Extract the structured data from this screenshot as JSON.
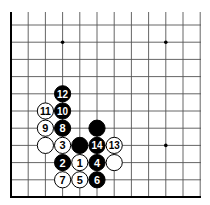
{
  "board": {
    "title": "Go board diagram (lower-left corner region)",
    "columns_visible": 12,
    "rows_visible": 11,
    "origin_x": 11,
    "origin_y": 197,
    "spacing": 17.2,
    "top_y": 12,
    "right_x": 201,
    "edges": {
      "left": true,
      "bottom": true,
      "top": false,
      "right": false
    },
    "colors": {
      "line": "#555555",
      "edge": "#000000",
      "black_stone": "#000000",
      "white_stone": "#ffffff",
      "stone_outline": "#000000"
    },
    "star_points": [
      {
        "col": 3,
        "row": 9
      },
      {
        "col": 9,
        "row": 9
      },
      {
        "col": 9,
        "row": 3
      }
    ],
    "stones": [
      {
        "color": "black",
        "col": 3,
        "row": 6,
        "label": "12"
      },
      {
        "color": "white",
        "col": 2,
        "row": 5,
        "label": "11"
      },
      {
        "color": "black",
        "col": 3,
        "row": 5,
        "label": "10"
      },
      {
        "color": "white",
        "col": 2,
        "row": 4,
        "label": "9"
      },
      {
        "color": "black",
        "col": 3,
        "row": 4,
        "label": "8"
      },
      {
        "color": "black",
        "col": 5,
        "row": 4,
        "label": ""
      },
      {
        "color": "white",
        "col": 2,
        "row": 3,
        "label": ""
      },
      {
        "color": "white",
        "col": 3,
        "row": 3,
        "label": "3"
      },
      {
        "color": "black",
        "col": 4,
        "row": 3,
        "label": ""
      },
      {
        "color": "black",
        "col": 5,
        "row": 3,
        "label": "14"
      },
      {
        "color": "white",
        "col": 6,
        "row": 3,
        "label": "13"
      },
      {
        "color": "black",
        "col": 3,
        "row": 2,
        "label": "2"
      },
      {
        "color": "white",
        "col": 4,
        "row": 2,
        "label": "1"
      },
      {
        "color": "black",
        "col": 5,
        "row": 2,
        "label": "4"
      },
      {
        "color": "white",
        "col": 6,
        "row": 2,
        "label": ""
      },
      {
        "color": "white",
        "col": 3,
        "row": 1,
        "label": "7"
      },
      {
        "color": "white",
        "col": 4,
        "row": 1,
        "label": "5"
      },
      {
        "color": "black",
        "col": 5,
        "row": 1,
        "label": "6"
      }
    ]
  }
}
